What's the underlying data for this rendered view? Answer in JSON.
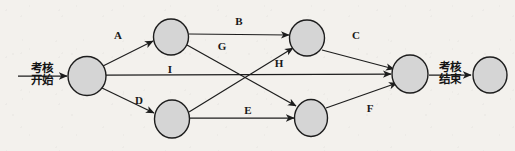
{
  "diagram": {
    "type": "activity-on-arrow network diagram",
    "colors": {
      "background": "#f3f1ed",
      "node_fill": "#d5d5d5",
      "node_stroke": "#1d1d1d",
      "edge": "#1d1d1d",
      "text": "#141414"
    },
    "terminal_labels": {
      "start": {
        "line1": "考核",
        "line2": "开始"
      },
      "end": {
        "line1": "考核",
        "line2": "结束"
      }
    },
    "nodes": [
      {
        "id": "n1",
        "label": "",
        "cx": 87,
        "cy": 76,
        "rx": 19,
        "ry": 19.5
      },
      {
        "id": "n2",
        "label": "",
        "cx": 171,
        "cy": 37,
        "rx": 17.5,
        "ry": 18
      },
      {
        "id": "n3",
        "label": "",
        "cx": 172,
        "cy": 119,
        "rx": 17.5,
        "ry": 19
      },
      {
        "id": "n4",
        "label": "",
        "cx": 307,
        "cy": 38,
        "rx": 17.5,
        "ry": 18
      },
      {
        "id": "n5",
        "label": "",
        "cx": 311,
        "cy": 118,
        "rx": 16.5,
        "ry": 18.5
      },
      {
        "id": "n6",
        "label": "",
        "cx": 410,
        "cy": 74,
        "rx": 18,
        "ry": 19
      },
      {
        "id": "n7",
        "label": "",
        "cx": 490,
        "cy": 75,
        "rx": 17,
        "ry": 18
      }
    ],
    "edges": [
      {
        "label": "A",
        "from": "n1",
        "to": "n2",
        "label_x": 118,
        "label_y": 35
      },
      {
        "label": "B",
        "from": "n2",
        "to": "n4",
        "label_x": 239,
        "label_y": 21
      },
      {
        "label": "G",
        "from": "n2",
        "to": "n5",
        "label_x": 222,
        "label_y": 46
      },
      {
        "label": "I",
        "from": "n1",
        "to": "n6",
        "label_x": 170,
        "label_y": 69
      },
      {
        "label": "D",
        "from": "n1",
        "to": "n3",
        "label_x": 139,
        "label_y": 100
      },
      {
        "label": "H",
        "from": "n3",
        "to": "n4",
        "label_x": 279,
        "label_y": 63
      },
      {
        "label": "E",
        "from": "n3",
        "to": "n5",
        "label_x": 248,
        "label_y": 110
      },
      {
        "label": "C",
        "from": "n4",
        "to": "n6",
        "label_x": 356,
        "label_y": 35
      },
      {
        "label": "F",
        "from": "n5",
        "to": "n6",
        "label_x": 370,
        "label_y": 108
      }
    ],
    "terminal_edges": [
      {
        "name": "start-arrow",
        "from_x": 18,
        "to_x": 67,
        "y": 76
      },
      {
        "name": "end-arrow",
        "from_x": 429,
        "to_x": 471,
        "y": 75
      }
    ]
  }
}
